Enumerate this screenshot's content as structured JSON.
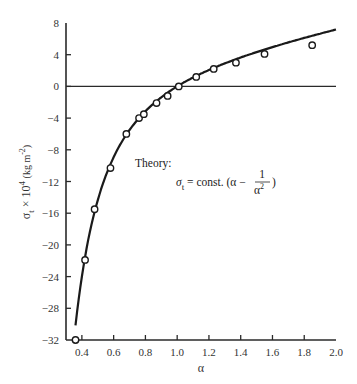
{
  "chart_data": {
    "type": "scatter",
    "title": "",
    "xlabel": "α",
    "ylabel": "σt × 10⁴ (kg m⁻²)",
    "ylabel_parts": {
      "sym": "σ",
      "sub": "t",
      "times": " × 10",
      "sup": "4",
      "unit": "(kg m",
      "unit_sup": "-2",
      "unit_close": ")"
    },
    "xlim": [
      0.3,
      2.0
    ],
    "ylim": [
      -32,
      8
    ],
    "x_ticks": [
      0.4,
      0.6,
      0.8,
      1.0,
      1.2,
      1.4,
      1.6,
      1.8,
      2.0
    ],
    "x_tick_labels": [
      "0.4",
      "0.6",
      "0.8",
      "1.0",
      "1.2",
      "1.4",
      "1.6",
      "1.8",
      "2.0"
    ],
    "y_ticks": [
      8,
      4,
      0,
      -4,
      -8,
      -12,
      -16,
      -20,
      -24,
      -28,
      -32
    ],
    "y_tick_labels": [
      "8",
      "4",
      "0",
      "−4",
      "−8",
      "−12",
      "−16",
      "−20",
      "−24",
      "−28",
      "−32"
    ],
    "grid": false,
    "zero_line": true,
    "series": [
      {
        "name": "Experiment",
        "marker": "open-circle",
        "x": [
          0.36,
          0.42,
          0.48,
          0.58,
          0.68,
          0.76,
          0.79,
          0.87,
          0.94,
          1.01,
          1.12,
          1.23,
          1.37,
          1.55,
          1.85
        ],
        "y": [
          -32.0,
          -21.9,
          -15.5,
          -10.3,
          -6.0,
          -4.0,
          -3.5,
          -2.1,
          -1.2,
          0.0,
          1.2,
          2.2,
          3.0,
          4.1,
          5.2
        ]
      },
      {
        "name": "Theory",
        "line": "solid",
        "formula": "σt = const. (α − 1/α²)",
        "const": 4.1,
        "x_range": [
          0.36,
          2.0
        ]
      }
    ],
    "annotations": [
      {
        "text": "Theory:",
        "x": 0.9,
        "y": -10.2
      },
      {
        "text": "σt = const. (α − 1/α²)",
        "x": 1.0,
        "y": -13.2
      }
    ]
  },
  "annotation": {
    "theory_label": "Theory:",
    "sigma": "σ",
    "sub_t": "t",
    "eq": " = const. (α −",
    "num": "1",
    "den": "α",
    "den_sup": "2",
    "close": ")"
  }
}
